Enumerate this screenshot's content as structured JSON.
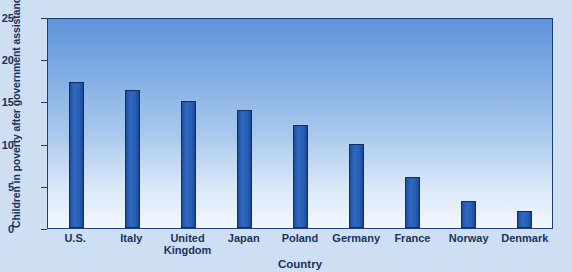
{
  "chart_data": {
    "type": "bar",
    "title": "",
    "xlabel": "Country",
    "ylabel": "Children in poverty after government assistance",
    "categories": [
      "U.S.",
      "Italy",
      "United Kingdom",
      "Japan",
      "Poland",
      "Germany",
      "France",
      "Norway",
      "Denmark"
    ],
    "category_lines": [
      [
        "U.S."
      ],
      [
        "Italy"
      ],
      [
        "United",
        "Kingdom"
      ],
      [
        "Japan"
      ],
      [
        "Poland"
      ],
      [
        "Germany"
      ],
      [
        "France"
      ],
      [
        "Norway"
      ],
      [
        "Denmark"
      ]
    ],
    "values": [
      17.6,
      16.6,
      15.3,
      14.2,
      12.4,
      10.1,
      6.1,
      3.2,
      2.1
    ],
    "ylim": [
      0,
      25
    ],
    "yticks": [
      0,
      5,
      10,
      15,
      20,
      25
    ],
    "ytick_labels": [
      "0",
      "5",
      "10",
      "15",
      "20",
      "25"
    ],
    "grid": false,
    "legend": null,
    "colors": {
      "bar_fill": "#2a5fb4",
      "bar_edge": "#11305f",
      "plot_top": "#5e93d8",
      "plot_bottom": "#f2f7fd",
      "axis": "#1d3f77",
      "text": "#16355e",
      "page_background": "#cfdff3"
    }
  }
}
